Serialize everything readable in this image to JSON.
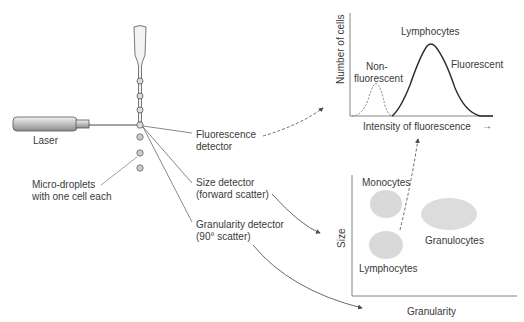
{
  "diagram": {
    "apparatus": {
      "laser_label": "Laser",
      "droplets_label_line1": "Micro-droplets",
      "droplets_label_line2": "with one cell each",
      "detectors": [
        {
          "line1": "Fluorescence",
          "line2": "detector"
        },
        {
          "line1": "Size detector",
          "line2": "(forward scatter)"
        },
        {
          "line1": "Granularity detector",
          "line2": "(90° scatter)"
        }
      ]
    },
    "histogram": {
      "ylabel": "Number of cells",
      "xlabel": "Intensity of fluorescence",
      "x_arrow": "→",
      "peak_label": "Lymphocytes",
      "nonfluor_line1": "Non-",
      "nonfluor_line2": "fluorescent",
      "fluor_label": "Fluorescent"
    },
    "scatterplot": {
      "ylabel": "Size",
      "xlabel": "Granularity",
      "clusters": [
        {
          "label": "Monocytes"
        },
        {
          "label": "Lymphocytes"
        },
        {
          "label": "Granulocytes"
        }
      ]
    },
    "colors": {
      "line": "#4a4a4a",
      "text": "#3a3a3a",
      "cluster_fill": "#d9d9d9"
    }
  }
}
